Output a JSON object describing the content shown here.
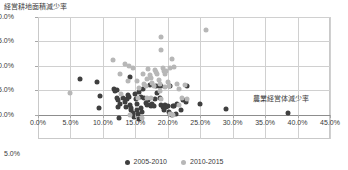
{
  "chart_data": {
    "type": "scatter",
    "title": "",
    "ylabel": "経営耕地面積減少率",
    "xlabel": "農業経営体減少率",
    "xlim": [
      0,
      45
    ],
    "ylim": [
      -5,
      20
    ],
    "grid": true,
    "legend_position": "bottom",
    "xticks": [
      "0.0%",
      "5.0%",
      "10.0%",
      "15.0%",
      "20.0%",
      "25.0%",
      "30.0%",
      "35.0%",
      "40.0%",
      "45.0%"
    ],
    "xtick_values": [
      0,
      5,
      10,
      15,
      20,
      25,
      30,
      35,
      40,
      45
    ],
    "yticks": [
      "20.0%",
      "15.0%",
      "10.0%",
      "5.0%",
      "0.0%"
    ],
    "ytick_values": [
      20,
      15,
      10,
      5,
      0
    ],
    "ytick_below_axis": "5.0%",
    "colors": {
      "series_2005_2010": "#3f3f3f",
      "series_2010_2015": "#b7b7b7",
      "grid": "#d0d0d0",
      "frame": "#c9c9c9",
      "axis": "#8d8d8d",
      "text": "#3a3a3a",
      "background": "#ffffff"
    },
    "series": [
      {
        "name": "2005-2010",
        "color": "#3f3f3f",
        "points": [
          [
            6.4,
            7.3
          ],
          [
            9.1,
            6.6
          ],
          [
            9.6,
            3.9
          ],
          [
            9.4,
            1.3
          ],
          [
            11.7,
            5.2
          ],
          [
            12.2,
            5.1
          ],
          [
            12.1,
            3.4
          ],
          [
            12.4,
            3.0
          ],
          [
            12.6,
            2.2
          ],
          [
            12.3,
            1.6
          ],
          [
            12.5,
            -0.7
          ],
          [
            13.1,
            3.4
          ],
          [
            13.4,
            2.6
          ],
          [
            13.6,
            1.6
          ],
          [
            13.7,
            3.1
          ],
          [
            14.0,
            3.7
          ],
          [
            14.2,
            2.0
          ],
          [
            14.3,
            0.9
          ],
          [
            14.4,
            1.3
          ],
          [
            14.6,
            0.4
          ],
          [
            14.8,
            -0.5
          ],
          [
            15.0,
            4.3
          ],
          [
            15.1,
            3.2
          ],
          [
            15.2,
            2.1
          ],
          [
            15.3,
            1.0
          ],
          [
            15.4,
            0.2
          ],
          [
            15.6,
            4.6
          ],
          [
            15.8,
            3.6
          ],
          [
            15.9,
            1.4
          ],
          [
            16.0,
            0.6
          ],
          [
            14.2,
            7.8
          ],
          [
            16.4,
            3.4
          ],
          [
            16.6,
            2.3
          ],
          [
            16.8,
            1.9
          ],
          [
            17.0,
            3.0
          ],
          [
            17.2,
            2.0
          ],
          [
            17.4,
            1.8
          ],
          [
            17.6,
            2.1
          ],
          [
            17.8,
            1.7
          ],
          [
            18.0,
            3.1
          ],
          [
            18.3,
            4.5
          ],
          [
            18.6,
            5.9
          ],
          [
            18.8,
            3.4
          ],
          [
            19.0,
            2.0
          ],
          [
            19.2,
            1.6
          ],
          [
            19.4,
            1.0
          ],
          [
            19.6,
            2.0
          ],
          [
            19.8,
            1.5
          ],
          [
            20.0,
            1.8
          ],
          [
            20.2,
            0.6
          ],
          [
            20.4,
            0.1
          ],
          [
            20.6,
            0.0
          ],
          [
            20.8,
            1.8
          ],
          [
            21.0,
            1.7
          ],
          [
            21.2,
            0.2
          ],
          [
            21.4,
            2.1
          ],
          [
            22.0,
            1.0
          ],
          [
            22.4,
            3.0
          ],
          [
            22.8,
            2.5
          ],
          [
            23.0,
            5.9
          ],
          [
            25.0,
            2.1
          ],
          [
            29.0,
            1.1
          ],
          [
            38.6,
            0.4
          ],
          [
            17.3,
            6.0
          ],
          [
            18.2,
            5.9
          ],
          [
            19.0,
            5.8
          ],
          [
            20.3,
            5.8
          ],
          [
            11.8,
            4.9
          ],
          [
            16.2,
            5.3
          ],
          [
            13.9,
            4.1
          ],
          [
            15.5,
            -0.8
          ]
        ]
      },
      {
        "name": "2010-2015",
        "color": "#b7b7b7",
        "points": [
          [
            4.9,
            4.5
          ],
          [
            11.6,
            11.1
          ],
          [
            12.6,
            8.4
          ],
          [
            13.4,
            10.3
          ],
          [
            14.1,
            10.0
          ],
          [
            14.6,
            9.6
          ],
          [
            15.2,
            6.8
          ],
          [
            15.6,
            5.4
          ],
          [
            16.2,
            8.4
          ],
          [
            16.4,
            6.2
          ],
          [
            16.6,
            5.9
          ],
          [
            16.8,
            7.3
          ],
          [
            17.0,
            9.3
          ],
          [
            17.2,
            8.2
          ],
          [
            17.4,
            7.4
          ],
          [
            17.6,
            6.5
          ],
          [
            17.8,
            5.9
          ],
          [
            18.0,
            9.2
          ],
          [
            18.2,
            8.8
          ],
          [
            18.4,
            8.3
          ],
          [
            18.6,
            7.0
          ],
          [
            18.8,
            6.3
          ],
          [
            19.0,
            13.3
          ],
          [
            19.0,
            15.9
          ],
          [
            19.2,
            9.5
          ],
          [
            19.4,
            8.9
          ],
          [
            19.6,
            8.4
          ],
          [
            19.8,
            9.0
          ],
          [
            20.0,
            6.7
          ],
          [
            20.2,
            5.8
          ],
          [
            20.4,
            9.5
          ],
          [
            20.6,
            11.3
          ],
          [
            21.0,
            9.8
          ],
          [
            21.4,
            6.2
          ],
          [
            21.8,
            5.2
          ],
          [
            22.2,
            3.4
          ],
          [
            22.6,
            6.0
          ],
          [
            23.0,
            3.1
          ],
          [
            19.0,
            3.2
          ],
          [
            17.4,
            3.4
          ],
          [
            16.8,
            3.3
          ],
          [
            15.4,
            3.5
          ],
          [
            14.2,
            0.0
          ],
          [
            16.0,
            -0.6
          ],
          [
            20.4,
            0.2
          ],
          [
            20.8,
            0.0
          ],
          [
            25.9,
            17.3
          ],
          [
            13.8,
            6.8
          ],
          [
            12.8,
            4.2
          ],
          [
            21.8,
            1.9
          ],
          [
            19.6,
            5.6
          ],
          [
            18.8,
            4.9
          ]
        ]
      }
    ]
  }
}
